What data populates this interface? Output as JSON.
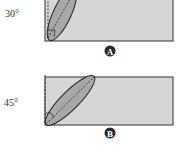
{
  "panels": [
    {
      "id": "A",
      "angle_label": "30°",
      "angle_degrees": 30,
      "badge_label": "A"
    },
    {
      "id": "B",
      "angle_label": "45°",
      "angle_degrees": 45,
      "badge_label": "B"
    }
  ],
  "colors": {
    "rect_fill": "#d6d6d6",
    "rect_stroke": "#333333",
    "ellipse_fill": "#a8a8a8",
    "ellipse_stroke": "#222222",
    "badge_fill": "#2a2a2a",
    "dash_stroke": "#222222"
  }
}
